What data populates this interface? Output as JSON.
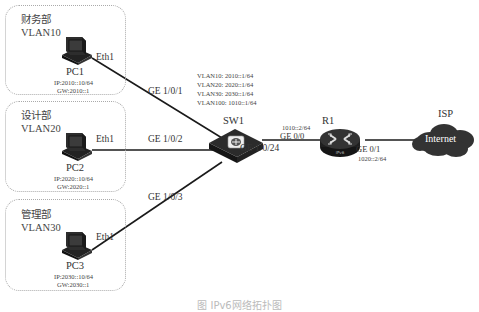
{
  "diagram": {
    "type": "network-topology",
    "departments": [
      {
        "name": "财务部",
        "vlan": "VLAN10",
        "pc": "PC1",
        "port": "Eth1",
        "ip": "IP:2010::10/64",
        "gw": "GW:2010::1",
        "switch_port": "GE 1/0/1"
      },
      {
        "name": "设计部",
        "vlan": "VLAN20",
        "pc": "PC2",
        "port": "Eth1",
        "ip": "IP:2020::10/64",
        "gw": "GW:2020::1",
        "switch_port": "GE 1/0/2"
      },
      {
        "name": "管理部",
        "vlan": "VLAN30",
        "pc": "PC3",
        "port": "Eth1",
        "ip": "IP:2030::10/64",
        "gw": "GW:2030::1",
        "switch_port": "GE 1/0/3"
      }
    ],
    "switch": {
      "name": "SW1",
      "vlan_interfaces": [
        "VLAN10: 2010::1/64",
        "VLAN20: 2020::1/64",
        "VLAN30: 2030::1/64",
        "VLAN100: 1010::1/64"
      ],
      "uplink_port": "GE 1/0/24"
    },
    "router": {
      "name": "R1",
      "badge": "IPv6",
      "port_in": "GE 0/0",
      "port_in_ip": "1010::2/64",
      "port_out": "GE 0/1",
      "port_out_ip": "1020::2/64"
    },
    "isp": {
      "name": "ISP",
      "cloud_label": "Internet"
    },
    "caption": "图  IPv6网络拓扑图"
  },
  "colors": {
    "line": "#1a1a1a",
    "device": "#2b2b2b",
    "box_border": "#aaaaaa"
  }
}
